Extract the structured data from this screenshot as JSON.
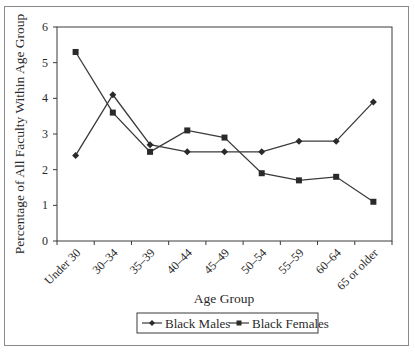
{
  "chart_data": {
    "type": "line",
    "title": "",
    "xlabel": "Age Group",
    "ylabel": "Percentage of All Faculty Within Age Group",
    "categories": [
      "Under 30",
      "30–34",
      "35–39",
      "40–44",
      "45–49",
      "50–54",
      "55–59",
      "60–64",
      "65 or older"
    ],
    "series": [
      {
        "name": "Black Males",
        "marker": "diamond",
        "values": [
          2.4,
          4.1,
          2.7,
          2.5,
          2.5,
          2.5,
          2.8,
          2.8,
          3.9
        ]
      },
      {
        "name": "Black Females",
        "marker": "square",
        "values": [
          5.3,
          3.6,
          2.5,
          3.1,
          2.9,
          1.9,
          1.7,
          1.8,
          1.1
        ]
      }
    ],
    "ylim": [
      0,
      6
    ],
    "yticks": [
      0,
      1,
      2,
      3,
      4,
      5,
      6
    ],
    "grid": false,
    "legend_position": "bottom",
    "line_color": "#3a3a3a"
  },
  "legend": {
    "items": [
      {
        "label": "Black Males",
        "marker": "diamond-icon"
      },
      {
        "label": "Black Females",
        "marker": "square-icon"
      }
    ]
  }
}
